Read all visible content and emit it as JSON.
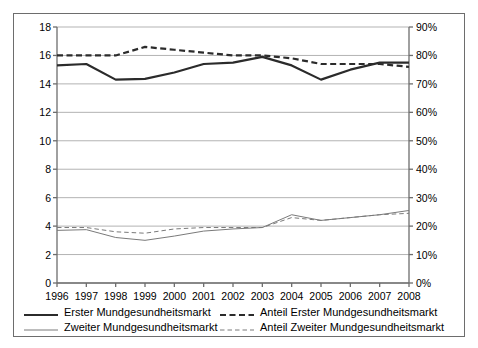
{
  "chart_data": {
    "type": "line",
    "title": "",
    "subtitle": "",
    "xlabel": "",
    "ylabel": "",
    "y2label": "",
    "grid": true,
    "legend_position": "bottom",
    "categories": [
      "1996",
      "1997",
      "1998",
      "1999",
      "2000",
      "2001",
      "2002",
      "2003",
      "2004",
      "2005",
      "2006",
      "2007",
      "2008"
    ],
    "x_tick_labels": [
      "1996",
      "1997",
      "1998",
      "1999",
      "2000",
      "2001",
      "2002",
      "2003",
      "2004",
      "2005",
      "2006",
      "2007",
      "2008"
    ],
    "y_tick_labels": [
      "0",
      "2",
      "4",
      "6",
      "8",
      "10",
      "12",
      "14",
      "16",
      "18"
    ],
    "y_tick_values": [
      0,
      2,
      4,
      6,
      8,
      10,
      12,
      14,
      16,
      18
    ],
    "ylim": [
      0,
      18
    ],
    "y2_tick_labels": [
      "0%",
      "10%",
      "20%",
      "30%",
      "40%",
      "50%",
      "60%",
      "70%",
      "80%",
      "90%"
    ],
    "y2_tick_values": [
      0,
      10,
      20,
      30,
      40,
      50,
      60,
      70,
      80,
      90
    ],
    "y2lim": [
      0,
      90
    ],
    "series": [
      {
        "name": "Erster Mundgesundheitsmarkt",
        "axis": "left",
        "style": "solid",
        "width": 2.2,
        "color": "#2b2b2b",
        "values": [
          15.3,
          15.4,
          14.3,
          14.35,
          14.8,
          15.4,
          15.5,
          15.9,
          15.3,
          14.3,
          15.0,
          15.5,
          15.5
        ]
      },
      {
        "name": "Zweiter Mundgesundheitsmarkt",
        "axis": "left",
        "style": "solid",
        "width": 1.0,
        "color": "#7a7a7a",
        "values": [
          3.7,
          3.75,
          3.2,
          3.0,
          3.3,
          3.65,
          3.8,
          3.9,
          4.8,
          4.4,
          4.6,
          4.8,
          5.1
        ]
      },
      {
        "name": "Anteil Erster Mundgesundheitsmarkt",
        "axis": "right",
        "style": "dashed",
        "width": 2.2,
        "color": "#2b2b2b",
        "values": [
          80,
          80,
          80,
          83,
          82,
          81,
          80,
          80,
          79,
          77,
          77,
          77,
          76
        ]
      },
      {
        "name": "Anteil Zweiter Mundgesundheitsmarkt",
        "axis": "right",
        "style": "dashed",
        "width": 1.0,
        "color": "#7a7a7a",
        "values": [
          19.5,
          19.5,
          18.0,
          17.5,
          19.0,
          19.5,
          19.5,
          19.5,
          23.0,
          22.0,
          23.0,
          24.0,
          24.5
        ]
      }
    ],
    "colors": {
      "primary": "#2b2b2b",
      "secondary": "#7a7a7a",
      "grid": "#b3b3b3",
      "axis": "#6d6d6d",
      "background": "#ffffff"
    }
  },
  "legend": {
    "entries": [
      {
        "label": "Erster Mundgesundheitsmarkt",
        "style": "solid",
        "weight": "thick"
      },
      {
        "label": "Anteil Erster Mundgesundheitsmarkt",
        "style": "dashed",
        "weight": "thick"
      },
      {
        "label": "Zweiter Mundgesundheitsmarkt",
        "style": "solid",
        "weight": "thin"
      },
      {
        "label": "Anteil Zweiter Mundgesundheitsmarkt",
        "style": "dashed",
        "weight": "thin"
      }
    ]
  }
}
